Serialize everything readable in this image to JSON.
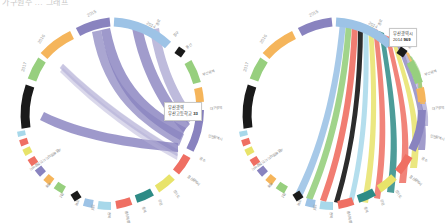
{
  "page": {
    "clipped_header": "가구원수 ... 그래프",
    "background": "#ffffff"
  },
  "charts": [
    {
      "id": "chart-left",
      "title": "",
      "side": "left",
      "tooltip": {
        "line1": "부산광역",
        "line2": "부산고등학교",
        "value": "33"
      }
    },
    {
      "id": "chart-right",
      "title": "",
      "side": "right",
      "tooltip": {
        "line1": "부산광역시",
        "line2": "2014",
        "value": "969"
      }
    }
  ],
  "chart_data": {
    "type": "chord",
    "title": "",
    "year_nodes": [
      {
        "label": "2014",
        "color": "#9dc3e6"
      },
      {
        "label": "2015",
        "color": "#8983bf"
      },
      {
        "label": "2016",
        "color": "#f5b55b"
      },
      {
        "label": "2017",
        "color": "#97cf7e"
      }
    ],
    "region_nodes": [
      {
        "label": "종로",
        "color": "#1a1a1a"
      },
      {
        "label": "중구",
        "color": "#97cf7e"
      },
      {
        "label": "용산",
        "color": "#f5b55b"
      },
      {
        "label": "부산광역",
        "color": "#8983bf"
      },
      {
        "label": "대구광역",
        "color": "#ef6f63"
      },
      {
        "label": "인천광역시",
        "color": "#e8e36a"
      },
      {
        "label": "광주",
        "color": "#2e8b86"
      },
      {
        "label": "울산광역시",
        "color": "#ef6f63"
      },
      {
        "label": "경기도",
        "color": "#a7d8ea"
      },
      {
        "label": "강원",
        "color": "#9dc3e6"
      },
      {
        "label": "충북",
        "color": "#1a1a1a"
      },
      {
        "label": "충남특별",
        "color": "#97cf7e"
      },
      {
        "label": "전북",
        "color": "#f5b55b"
      },
      {
        "label": "전남",
        "color": "#8983bf"
      },
      {
        "label": "경북",
        "color": "#ef6f63"
      },
      {
        "label": "경남",
        "color": "#e8e36a"
      },
      {
        "label": "제주",
        "color": "#a7d8ea"
      },
      {
        "label": "세종특별자치시 인천광역시",
        "color": "#a7d8ea"
      }
    ],
    "left_chart": {
      "dominant_ribbon_color": "#8983bf",
      "ribbon_count": 6,
      "notes": "Single-series (2015/purple) fan of ribbons converging on the 부산광역 node"
    },
    "right_chart": {
      "ribbon_colors": [
        "#9dc3e6",
        "#97cf7e",
        "#ef6f63",
        "#1a1a1a",
        "#e8e36a",
        "#f5b55b",
        "#2e8b86",
        "#a7d8ea",
        "#8983bf"
      ],
      "ribbon_count": 14,
      "notes": "Multi-coloured fan of ribbons from the 2014 arc out to every region node"
    }
  }
}
